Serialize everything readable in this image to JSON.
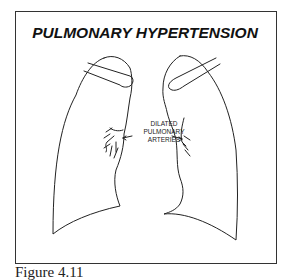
{
  "figure": {
    "title": "PULMONARY HYPERTENSION",
    "annotation_lines": [
      "DILATED",
      "PULMONARY",
      "ARTERIES"
    ],
    "caption": "Figure 4.11",
    "line_color": "#222222"
  }
}
